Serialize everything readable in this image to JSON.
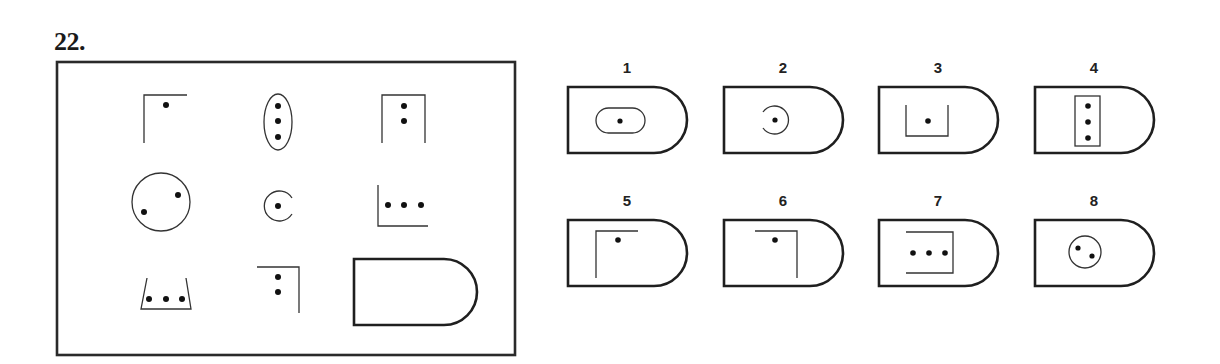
{
  "question": {
    "number": "22.",
    "matrix": {
      "rows": 3,
      "cols": 3,
      "cells": [
        {
          "row": 1,
          "col": 1,
          "shape": "corner-top-left",
          "dots": 1
        },
        {
          "row": 1,
          "col": 2,
          "shape": "ellipse-vertical",
          "dots": 3
        },
        {
          "row": 1,
          "col": 3,
          "shape": "box-open-bottom",
          "dots": 2
        },
        {
          "row": 2,
          "col": 1,
          "shape": "circle",
          "dots": 2
        },
        {
          "row": 2,
          "col": 2,
          "shape": "c-open-right",
          "dots": 1
        },
        {
          "row": 2,
          "col": 3,
          "shape": "corner-bottom-left",
          "dots": 3
        },
        {
          "row": 3,
          "col": 1,
          "shape": "trapezoid-cup",
          "dots": 3
        },
        {
          "row": 3,
          "col": 2,
          "shape": "corner-top-right",
          "dots": 2
        },
        {
          "row": 3,
          "col": 3,
          "shape": "blank-answer-slot",
          "dots": 0
        }
      ]
    },
    "options": [
      {
        "label": "1",
        "shape": "rounded-rect",
        "dots": 1
      },
      {
        "label": "2",
        "shape": "c-open-left",
        "dots": 1
      },
      {
        "label": "3",
        "shape": "u-open-top",
        "dots": 1
      },
      {
        "label": "4",
        "shape": "rect-vertical",
        "dots": 3
      },
      {
        "label": "5",
        "shape": "corner-top-left",
        "dots": 1
      },
      {
        "label": "6",
        "shape": "corner-top-right",
        "dots": 1
      },
      {
        "label": "7",
        "shape": "bracket-open-left",
        "dots": 3
      },
      {
        "label": "8",
        "shape": "circle",
        "dots": 2
      }
    ]
  },
  "colors": {
    "line": "#333333",
    "dot": "#111111",
    "background": "#ffffff"
  }
}
